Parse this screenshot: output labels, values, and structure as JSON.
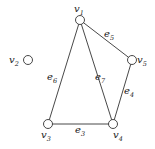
{
  "diagram": {
    "type": "graph",
    "nodes": [
      {
        "id": "v1",
        "label": "v",
        "sub": "1",
        "x": 80,
        "y": 20,
        "lx": 74,
        "ly": 12
      },
      {
        "id": "v2",
        "label": "v",
        "sub": "2",
        "x": 28,
        "y": 60,
        "lx": 9,
        "ly": 63
      },
      {
        "id": "v3",
        "label": "v",
        "sub": "3",
        "x": 48,
        "y": 124,
        "lx": 41,
        "ly": 138
      },
      {
        "id": "v4",
        "label": "v",
        "sub": "4",
        "x": 113,
        "y": 124,
        "lx": 113,
        "ly": 138
      },
      {
        "id": "v5",
        "label": "v",
        "sub": "5",
        "x": 132,
        "y": 60,
        "lx": 137,
        "ly": 63
      }
    ],
    "edges": [
      {
        "id": "e3",
        "label": "e",
        "sub": "3",
        "from": "v3",
        "to": "v4",
        "lx": 75,
        "ly": 133
      },
      {
        "id": "e4",
        "label": "e",
        "sub": "4",
        "from": "v5",
        "to": "v4",
        "lx": 124,
        "ly": 94
      },
      {
        "id": "e5",
        "label": "e",
        "sub": "5",
        "from": "v1",
        "to": "v5",
        "lx": 104,
        "ly": 37
      },
      {
        "id": "e6",
        "label": "e",
        "sub": "6",
        "from": "v1",
        "to": "v3",
        "lx": 47,
        "ly": 80
      },
      {
        "id": "e7",
        "label": "e",
        "sub": "7",
        "from": "v1",
        "to": "v4",
        "lx": 95,
        "ly": 80
      }
    ]
  }
}
